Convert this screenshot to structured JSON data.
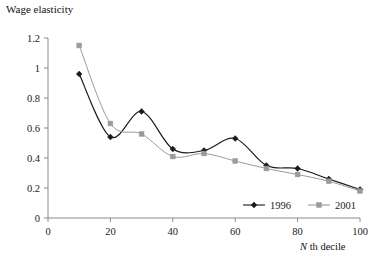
{
  "chart_data": {
    "type": "line",
    "title": "",
    "ylabel": "Wage elasticity",
    "xlabel": "N th decile",
    "xlabel_italic_part": "N",
    "xlabel_rest": " th decile",
    "x": [
      10,
      20,
      30,
      40,
      50,
      60,
      70,
      80,
      90,
      100
    ],
    "xlim": [
      0,
      100
    ],
    "ylim": [
      0,
      1.2
    ],
    "xticks": [
      0,
      20,
      40,
      60,
      80,
      100
    ],
    "xtick_labels": [
      "0",
      "20",
      "40",
      "60",
      "80",
      "100"
    ],
    "yticks": [
      0,
      0.2,
      0.4,
      0.6,
      0.8,
      1,
      1.2
    ],
    "ytick_labels": [
      "0",
      "0.2",
      "0.4",
      "0.6",
      "0.8",
      "1",
      "1.2"
    ],
    "grid": false,
    "legend_position": "inside-bottom-right",
    "series": [
      {
        "name": "1996",
        "color": "#1a1a1a",
        "marker": "diamond",
        "values": [
          0.96,
          0.54,
          0.71,
          0.46,
          0.45,
          0.53,
          0.35,
          0.33,
          0.26,
          0.19
        ]
      },
      {
        "name": "2001",
        "color": "#9a9a9a",
        "marker": "square",
        "values": [
          1.15,
          0.63,
          0.56,
          0.41,
          0.43,
          0.38,
          0.33,
          0.29,
          0.245,
          0.18
        ]
      }
    ]
  },
  "legend": {
    "entries": [
      {
        "label": "1996",
        "marker": "diamond-marker",
        "color": "#1a1a1a"
      },
      {
        "label": "2001",
        "marker": "square-marker",
        "color": "#9a9a9a"
      }
    ]
  },
  "axes": {
    "y_title": "Wage elasticity",
    "x_title_italic": "N",
    "x_title_rest": " th decile"
  },
  "colors": {
    "series_1996": "#1a1a1a",
    "series_2001": "#9a9a9a",
    "axis": "#888888",
    "background": "#ffffff"
  }
}
